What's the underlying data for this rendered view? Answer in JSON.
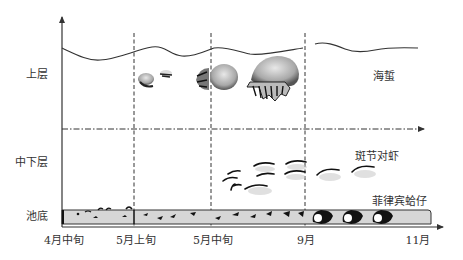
{
  "diagram": {
    "type": "polyculture-timeline",
    "layers": [
      {
        "id": "upper",
        "label": "上层"
      },
      {
        "id": "middle-lower",
        "label": "中下层"
      },
      {
        "id": "bottom",
        "label": "池底"
      }
    ],
    "time_axis": [
      {
        "label": "4月中旬"
      },
      {
        "label": "5月上旬"
      },
      {
        "label": "5月中旬"
      },
      {
        "label": "9月"
      },
      {
        "label": "11月"
      }
    ],
    "species": [
      {
        "id": "jellyfish",
        "label": "海蜇",
        "layer": "upper",
        "period": "5月上旬 – 9月"
      },
      {
        "id": "shrimp",
        "label": "斑节对虾",
        "layer": "middle-lower",
        "period": "5月中旬 – 11月"
      },
      {
        "id": "clam",
        "label": "菲律宾蛤仔",
        "layer": "bottom",
        "period": "4月中旬 – 11月"
      }
    ],
    "colors": {
      "line": "#333333",
      "pond_bottom_fill": "#d6d6d6",
      "organism": "#1a1a1a",
      "organism_shade": "#9a9a9a"
    }
  }
}
